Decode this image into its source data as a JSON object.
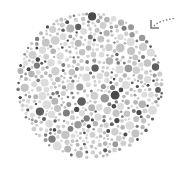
{
  "plate": {
    "type": "dot-pattern-plate",
    "center": [
      90,
      85
    ],
    "radius": 74,
    "dot_count": 900,
    "seed": 17,
    "colors": [
      "#dcdcdc",
      "#cfcfcf",
      "#c4c4c4",
      "#b5b5b5",
      "#9a9a9a",
      "#7d7d7d",
      "#5e5e5e",
      "#4a4a4a"
    ],
    "color_weights": [
      22,
      20,
      16,
      12,
      9,
      8,
      7,
      6
    ],
    "min_dot_radius": 1.2,
    "max_dot_radius": 4.6
  },
  "arrow": {
    "icon": "dotted-curved-arrow-icon",
    "color": "#7a7a7a"
  }
}
